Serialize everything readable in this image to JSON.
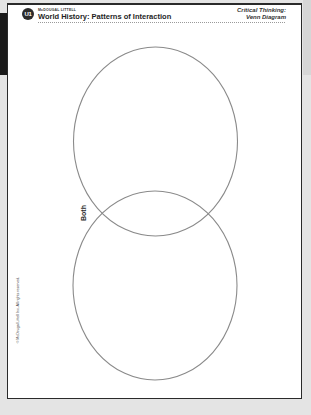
{
  "header": {
    "logo_text": "U1",
    "publisher": "McDOUGAL LITTELL",
    "title": "World History: Patterns of Interaction",
    "activity_line1": "Critical Thinking:",
    "activity_line2": "Venn Diagram"
  },
  "diagram": {
    "type": "venn",
    "circles": [
      {
        "name": "top-circle",
        "cx": 155.5,
        "cy": 141.5,
        "rx": 82,
        "ry": 94.5
      },
      {
        "name": "bottom-circle",
        "cx": 155,
        "cy": 285.5,
        "rx": 82,
        "ry": 94.5
      }
    ],
    "overlap_label": "Both",
    "stroke_color": "#8a8a8a"
  },
  "footer": {
    "copyright": "© McDougal Littell Inc. All rights reserved."
  },
  "colors": {
    "background": "#e4e4e4",
    "page": "#ffffff",
    "border": "#2a2a2a"
  }
}
